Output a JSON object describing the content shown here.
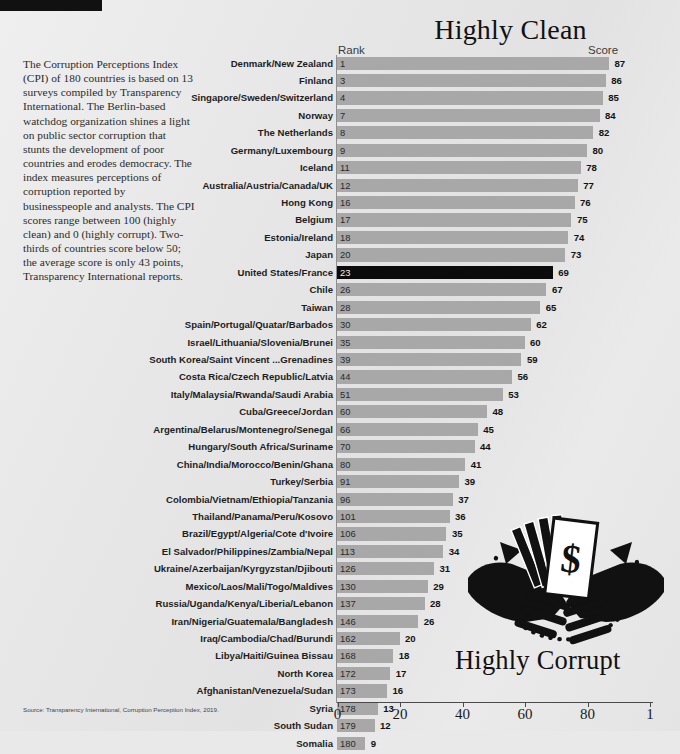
{
  "titles": {
    "clean": "Highly Clean",
    "corrupt": "Highly Corrupt"
  },
  "intro_text": "The Corruption Perceptions Index (CPI) of 180 countries is based on 13 surveys compiled by Transparency International. The Berlin-based watchdog organization shines a light on public sector corruption that stunts the development of poor countries and erodes democracy. The index measures perceptions of corruption reported by businesspeople and analysts. The CPI scores range between 100 (highly clean) and 0 (highly corrupt). Two-thirds of countries score below 50; the average score is only 43 points, Transparency International reports.",
  "headers": {
    "rank": "Rank",
    "score": "Score"
  },
  "source": "Source: Transparency International, Corruption Perception Index, 2019.",
  "colors": {
    "bar": "#a8a8a8",
    "bar_highlight": "#0b0b0b",
    "background": "#e7e7e7",
    "text": "#1d1d1d"
  },
  "chart_data": {
    "type": "bar",
    "title": "Highly Clean",
    "subtitle": "Highly Corrupt",
    "orientation": "horizontal",
    "xlabel": "",
    "ylabel": "",
    "xlim": [
      0,
      100
    ],
    "xticks": [
      0,
      20,
      40,
      60,
      80,
      100
    ],
    "xtick_labels": [
      "0",
      "20",
      "40",
      "60",
      "80",
      "1"
    ],
    "grid": false,
    "legend": "none",
    "highlight_category": "United States/France",
    "columns": [
      "Country",
      "Rank",
      "Score"
    ],
    "categories": [
      "Denmark/New Zealand",
      "Finland",
      "Singapore/Sweden/Switzerland",
      "Norway",
      "The Netherlands",
      "Germany/Luxembourg",
      "Iceland",
      "Australia/Austria/Canada/UK",
      "Hong Kong",
      "Belgium",
      "Estonia/Ireland",
      "Japan",
      "United States/France",
      "Chile",
      "Taiwan",
      "Spain/Portugal/Quatar/Barbados",
      "Israel/Lithuania/Slovenia/Brunei",
      "South Korea/Saint Vincent ...Grenadines",
      "Costa Rica/Czech Republic/Latvia",
      "Italy/Malaysia/Rwanda/Saudi Arabia",
      "Cuba/Greece/Jordan",
      "Argentina/Belarus/Montenegro/Senegal",
      "Hungary/South Africa/Suriname",
      "China/India/Morocco/Benin/Ghana",
      "Turkey/Serbia",
      "Colombia/Vietnam/Ethiopia/Tanzania",
      "Thailand/Panama/Peru/Kosovo",
      "Brazil/Egypt/Algeria/Cote d'Ivoire",
      "El Salvador/Philippines/Zambia/Nepal",
      "Ukraine/Azerbaijan/Kyrgyzstan/Djibouti",
      "Mexico/Laos/Mali/Togo/Maldives",
      "Russia/Uganda/Kenya/Liberia/Lebanon",
      "Iran/Nigeria/Guatemala/Bangladesh",
      "Iraq/Cambodia/Chad/Burundi",
      "Libya/Haiti/Guinea Bissau",
      "North Korea",
      "Afghanistan/Venezuela/Sudan",
      "Syria",
      "South Sudan",
      "Somalia"
    ],
    "ranks": [
      1,
      3,
      4,
      7,
      8,
      9,
      11,
      12,
      16,
      17,
      18,
      20,
      23,
      26,
      28,
      30,
      35,
      39,
      44,
      51,
      60,
      66,
      70,
      80,
      91,
      96,
      101,
      106,
      113,
      126,
      130,
      137,
      146,
      162,
      168,
      172,
      173,
      178,
      179,
      180
    ],
    "values": [
      87,
      86,
      85,
      84,
      82,
      80,
      78,
      77,
      76,
      75,
      74,
      73,
      69,
      67,
      65,
      62,
      60,
      59,
      56,
      53,
      48,
      45,
      44,
      41,
      39,
      37,
      36,
      35,
      34,
      31,
      29,
      28,
      26,
      20,
      18,
      17,
      16,
      13,
      12,
      9
    ]
  }
}
